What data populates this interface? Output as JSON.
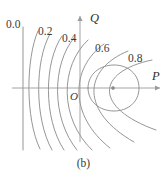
{
  "figure": {
    "caption": "(b)",
    "caption_top": 158
  },
  "axes": {
    "x_axis": {
      "label": "P",
      "label_left": 152,
      "label_top": 70,
      "y": 88,
      "x_start": 12,
      "x_end": 160,
      "arrow": "arrow-right"
    },
    "y_axis": {
      "label": "Q",
      "label_left": 90,
      "label_top": 12,
      "x": 80,
      "y_start": 16,
      "y_end": 142,
      "arrow": "arrow-up"
    },
    "origin": {
      "label": "O",
      "label_left": 70,
      "label_top": 91
    },
    "center_point": {
      "x": 113,
      "y": 88
    }
  },
  "chart_data": {
    "type": "line",
    "title": "",
    "subtitle": "",
    "xlabel": "P",
    "ylabel": "Q",
    "grid": false,
    "legend_position": "inline-labels",
    "contour_levels": [
      0.0,
      0.2,
      0.4,
      0.6,
      0.8
    ],
    "contour_label_texts": [
      "0.0",
      "0.2",
      "0.4",
      "0.6",
      "0.8"
    ],
    "contour_label_positions": [
      {
        "value": "0.0",
        "left": 6,
        "top": 19
      },
      {
        "value": "0.2",
        "left": 38,
        "top": 26
      },
      {
        "value": "0.4",
        "left": 62,
        "top": 33
      },
      {
        "value": "0.6",
        "left": 95,
        "top": 43
      },
      {
        "value": "0.8",
        "left": 128,
        "top": 53
      }
    ],
    "curves": [
      {
        "level": "0.0",
        "shape": "vertical-line",
        "path": "M 23 27 L 23 150"
      },
      {
        "level": "0.2-a",
        "shape": "open-left",
        "path": "M 38 31 C 26 58, 25 118, 40 149"
      },
      {
        "level": "0.2-b",
        "shape": "open-left",
        "path": "M 50 34 C 35 60, 34 118, 52 150"
      },
      {
        "level": "0.4-a",
        "shape": "open-left",
        "path": "M 62 36 C 44 62, 43 118, 64 150"
      },
      {
        "level": "0.4-b",
        "shape": "open-left",
        "path": "M 74 38 C 52 64, 51 118, 77 150"
      },
      {
        "level": "0.5",
        "shape": "open-left",
        "path": "M 88 40 C 60 66, 59 118, 92 150"
      },
      {
        "level": "0.6",
        "shape": "open-left",
        "path": "M 104 44 C 70 68, 69 116, 110 148"
      },
      {
        "level": "0.7",
        "shape": "open-left",
        "path": "M 128 51 C 82 70, 81 112, 134 142"
      },
      {
        "level": "0.8",
        "shape": "open-left",
        "path": "M 152 60 C 95 72, 94 108, 156 130"
      },
      {
        "level": "0.9",
        "shape": "closed-ellipse",
        "path": "M 88 88 C 88 74, 100 65, 114 65 C 128 65, 139 74, 139 88 C 139 102, 128 111, 114 111 C 100 111, 88 102, 88 88 Z"
      }
    ],
    "axis_ranges": {
      "x": [
        12,
        160
      ],
      "y": [
        16,
        150
      ]
    }
  }
}
